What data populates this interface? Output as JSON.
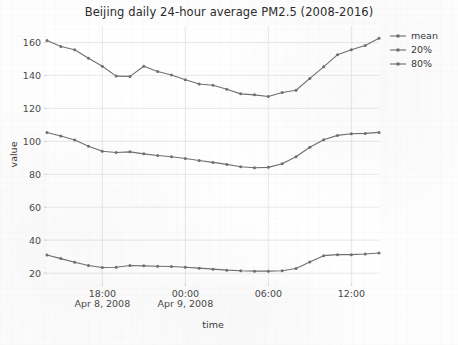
{
  "chart_data": {
    "type": "line",
    "title": "Beijing daily 24-hour average PM2.5 (2008-2016)",
    "xlabel": "time",
    "ylabel": "value",
    "grid": true,
    "legend_position": "right-top",
    "ylim": [
      14,
      170
    ],
    "yticks": [
      20,
      40,
      60,
      80,
      100,
      120,
      140,
      160
    ],
    "xlim_hours": [
      14,
      38
    ],
    "xticks_hours": [
      18,
      24,
      30,
      36
    ],
    "xtick_labels": [
      "18:00",
      "00:00",
      "06:00",
      "12:00"
    ],
    "xtick_sublabels": [
      "Apr 8, 2008",
      "Apr 9, 2008",
      "",
      ""
    ],
    "x_hours": [
      14,
      15,
      16,
      17,
      18,
      19,
      20,
      21,
      22,
      23,
      24,
      25,
      26,
      27,
      28,
      29,
      30,
      31,
      32,
      33,
      34,
      35,
      36,
      37,
      38
    ],
    "series": [
      {
        "name": "mean",
        "color": "#707070",
        "values": [
          105.4,
          103.2,
          100.8,
          97.0,
          94.0,
          93.2,
          93.6,
          92.4,
          91.4,
          90.6,
          89.6,
          88.4,
          87.2,
          86.0,
          84.6,
          84.0,
          84.2,
          86.4,
          90.6,
          96.4,
          101.0,
          103.6,
          104.6,
          104.8,
          105.4
        ]
      },
      {
        "name": "20%",
        "color": "#707070",
        "values": [
          31.0,
          28.8,
          26.6,
          24.6,
          23.4,
          23.6,
          24.6,
          24.4,
          24.2,
          24.0,
          23.6,
          23.0,
          22.4,
          21.8,
          21.4,
          21.2,
          21.2,
          21.4,
          22.8,
          26.8,
          30.6,
          31.2,
          31.2,
          31.6,
          32.2
        ]
      },
      {
        "name": "80%",
        "color": "#707070",
        "values": [
          161.2,
          157.6,
          155.6,
          150.4,
          145.6,
          139.6,
          139.4,
          145.6,
          142.4,
          140.2,
          137.4,
          134.8,
          134.0,
          131.6,
          128.8,
          128.2,
          127.2,
          129.6,
          131.0,
          138.2,
          145.2,
          152.6,
          155.6,
          158.2,
          162.6
        ]
      }
    ],
    "legend": [
      {
        "label": "mean",
        "color": "#707070"
      },
      {
        "label": "20%",
        "color": "#707070"
      },
      {
        "label": "80%",
        "color": "#707070"
      }
    ]
  }
}
